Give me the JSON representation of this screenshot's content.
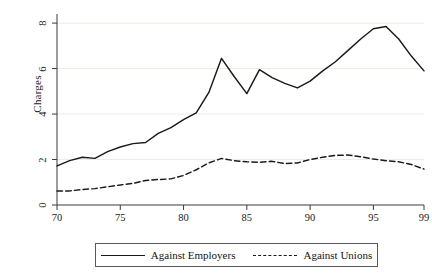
{
  "chart_data": {
    "type": "line",
    "title": "",
    "xlabel": "",
    "ylabel": "Charges",
    "xlim": [
      70,
      99
    ],
    "ylim": [
      0,
      8.4
    ],
    "grid": true,
    "grid_axis": "y",
    "legend_position": "bottom-outside",
    "x": [
      70,
      71,
      72,
      73,
      74,
      75,
      76,
      77,
      78,
      79,
      80,
      81,
      82,
      83,
      84,
      85,
      86,
      87,
      88,
      89,
      90,
      91,
      92,
      93,
      94,
      95,
      96,
      97,
      98,
      99
    ],
    "xticks": [
      70,
      75,
      80,
      85,
      90,
      95,
      99
    ],
    "xtick_labels": [
      "70",
      "75",
      "80",
      "85",
      "90",
      "95",
      "99"
    ],
    "yticks": [
      0,
      2,
      4,
      6,
      8
    ],
    "ytick_labels": [
      "0",
      "2",
      "4",
      "6",
      "8"
    ],
    "series": [
      {
        "name": "Against Employers",
        "style": "solid",
        "color": "#1a1a1a",
        "values": [
          1.72,
          1.95,
          2.1,
          2.05,
          2.35,
          2.55,
          2.7,
          2.75,
          3.15,
          3.4,
          3.75,
          4.05,
          4.95,
          6.45,
          5.65,
          4.9,
          5.95,
          5.6,
          5.35,
          5.15,
          5.45,
          5.9,
          6.3,
          6.8,
          7.3,
          7.75,
          7.85,
          7.3,
          6.55,
          5.9
        ]
      },
      {
        "name": "Against Unions",
        "style": "dashed",
        "color": "#1a1a1a",
        "values": [
          0.62,
          0.62,
          0.68,
          0.72,
          0.8,
          0.88,
          0.95,
          1.08,
          1.12,
          1.15,
          1.3,
          1.55,
          1.85,
          2.05,
          1.95,
          1.9,
          1.88,
          1.92,
          1.82,
          1.85,
          2.0,
          2.1,
          2.18,
          2.2,
          2.12,
          2.02,
          1.95,
          1.9,
          1.78,
          1.58
        ]
      }
    ]
  },
  "legend": {
    "entries": [
      {
        "label": "Against Employers",
        "style": "solid"
      },
      {
        "label": "Against Unions",
        "style": "dashed"
      }
    ]
  }
}
